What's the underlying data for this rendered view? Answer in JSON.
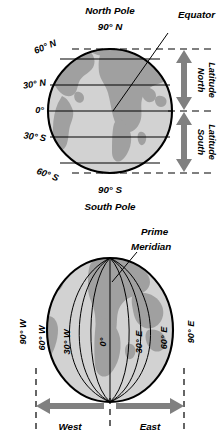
{
  "figure": {
    "colors": {
      "ocean": "#d2d2d2",
      "land": "#a0a0a0",
      "arrow": "#808080",
      "line": "#000000",
      "background": "#ffffff"
    }
  },
  "latitude_diagram": {
    "name": "latitude-globe",
    "top_label": "North Pole",
    "top_value": "90° N",
    "bottom_value": "90° S",
    "bottom_label": "South Pole",
    "equator_label": "Equator",
    "left_labels": [
      {
        "text": "60° N",
        "value": 60,
        "hemisphere": "N"
      },
      {
        "text": "30° N",
        "value": 30,
        "hemisphere": "N"
      },
      {
        "text": "0°",
        "value": 0,
        "hemisphere": ""
      },
      {
        "text": "30° S",
        "value": -30,
        "hemisphere": "S"
      },
      {
        "text": "60° S",
        "value": -60,
        "hemisphere": "S"
      }
    ],
    "range_arrows": [
      {
        "label_line1": "North",
        "label_line2": "Latitude",
        "from": "0°",
        "to": "90° N"
      },
      {
        "label_line1": "South",
        "label_line2": "Latitude",
        "from": "0°",
        "to": "90° S"
      }
    ]
  },
  "longitude_diagram": {
    "name": "longitude-globe",
    "prime_meridian_label_line1": "Prime",
    "prime_meridian_label_line2": "Meridian",
    "meridian_labels": [
      {
        "text": "90° W",
        "value": -90,
        "hemisphere": "W"
      },
      {
        "text": "60° W",
        "value": -60,
        "hemisphere": "W"
      },
      {
        "text": "30° W",
        "value": -30,
        "hemisphere": "W"
      },
      {
        "text": "0°",
        "value": 0,
        "hemisphere": ""
      },
      {
        "text": "30° E",
        "value": 30,
        "hemisphere": "E"
      },
      {
        "text": "60° E",
        "value": 60,
        "hemisphere": "E"
      },
      {
        "text": "90° E",
        "value": 90,
        "hemisphere": "E"
      }
    ],
    "range_arrows": [
      {
        "label": "West",
        "from": "90° W",
        "to": "0°"
      },
      {
        "label": "East",
        "from": "0°",
        "to": "90° E"
      }
    ]
  }
}
